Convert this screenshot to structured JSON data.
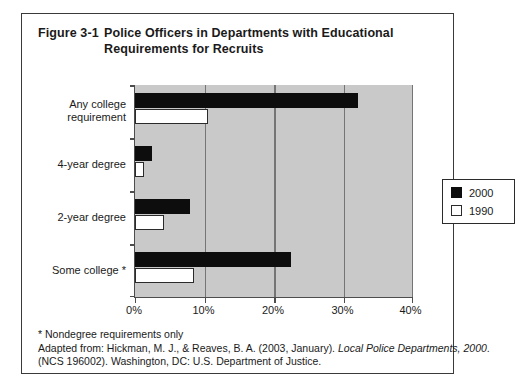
{
  "figure": {
    "number": "Figure 3-1",
    "title": "Police Officers in Departments with Educational Requirements for Recruits",
    "title_line1": "Police Officers in Departments with Educational",
    "title_line2": "Requirements for Recruits"
  },
  "legend": {
    "items": [
      {
        "label": "2000",
        "swatch": "filled-square-icon",
        "color": "#0d0d0d"
      },
      {
        "label": "1990",
        "swatch": "hollow-square-icon",
        "color": "#ffffff"
      }
    ]
  },
  "axis": {
    "x_ticks": [
      "0%",
      "10%",
      "20%",
      "30%",
      "40%"
    ],
    "y_labels_line1": [
      "Any college",
      "4-year degree",
      "2-year degree",
      "Some college *"
    ],
    "y_labels_line2": [
      "requirement",
      "",
      "",
      ""
    ]
  },
  "footnotes": {
    "line1": "* Nondegree requirements only",
    "line2_a": "Adapted from: Hickman, M. J., & Reaves, B. A. (2003, January). ",
    "line2_b": "Local Police Departments, 2000",
    "line3": "(NCS 196002). Washington, DC: U.S. Department of Justice."
  },
  "colors": {
    "plot_background": "#c9c9c9",
    "gridline": "#757575",
    "axis": "#4d4d4d",
    "series_2000": "#0d0d0d",
    "series_1990": "#ffffff",
    "frame": "#3a3a3a"
  },
  "chart_data": {
    "type": "bar",
    "orientation": "horizontal",
    "title": "Police Officers in Departments with Educational Requirements for Recruits",
    "xlabel": "",
    "ylabel": "",
    "xlim": [
      0,
      40
    ],
    "x_unit": "percent",
    "grid": true,
    "legend_position": "center-right inside plot",
    "categories": [
      "Any college requirement",
      "4-year degree",
      "2-year degree",
      "Some college *"
    ],
    "series": [
      {
        "name": "2000",
        "values": [
          32.0,
          2.4,
          7.9,
          22.3
        ]
      },
      {
        "name": "1990",
        "values": [
          10.5,
          1.3,
          4.1,
          8.4
        ]
      }
    ],
    "tick_values": [
      0,
      10,
      20,
      30,
      40
    ],
    "tick_labels": [
      "0%",
      "10%",
      "20%",
      "30%",
      "40%"
    ]
  }
}
